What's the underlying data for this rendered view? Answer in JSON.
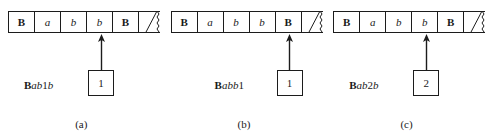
{
  "figure": {
    "type": "turing-machine-tape-configurations",
    "panels": [
      {
        "caption": "(a)",
        "tape": {
          "cells": [
            {
              "symbol": "B",
              "style": "bold"
            },
            {
              "symbol": "a",
              "style": "italic"
            },
            {
              "symbol": "b",
              "style": "italic"
            },
            {
              "symbol": "b",
              "style": "italic"
            },
            {
              "symbol": "B",
              "style": "bold"
            }
          ],
          "has_torn_end": true
        },
        "head_cell_index": 3,
        "state": "1",
        "config_label": {
          "text": "Bab1b",
          "parts": [
            {
              "text": "B",
              "style": "bold"
            },
            {
              "text": "ab",
              "style": "italic"
            },
            {
              "text": "1",
              "style": "normal"
            },
            {
              "text": "b",
              "style": "italic"
            }
          ]
        }
      },
      {
        "caption": "(b)",
        "tape": {
          "cells": [
            {
              "symbol": "B",
              "style": "bold"
            },
            {
              "symbol": "a",
              "style": "italic"
            },
            {
              "symbol": "b",
              "style": "italic"
            },
            {
              "symbol": "b",
              "style": "italic"
            },
            {
              "symbol": "B",
              "style": "bold"
            }
          ],
          "has_torn_end": true
        },
        "head_cell_index": 4,
        "state": "1",
        "config_label": {
          "text": "Babb1",
          "parts": [
            {
              "text": "B",
              "style": "bold"
            },
            {
              "text": "abb",
              "style": "italic"
            },
            {
              "text": "1",
              "style": "normal"
            }
          ]
        }
      },
      {
        "caption": "(c)",
        "tape": {
          "cells": [
            {
              "symbol": "B",
              "style": "bold"
            },
            {
              "symbol": "a",
              "style": "italic"
            },
            {
              "symbol": "b",
              "style": "italic"
            },
            {
              "symbol": "b",
              "style": "italic"
            },
            {
              "symbol": "B",
              "style": "bold"
            }
          ],
          "has_torn_end": true
        },
        "head_cell_index": 3,
        "state": "2",
        "config_label": {
          "text": "Bab2b",
          "parts": [
            {
              "text": "B",
              "style": "bold"
            },
            {
              "text": "ab",
              "style": "italic"
            },
            {
              "text": "2",
              "style": "normal"
            },
            {
              "text": "b",
              "style": "italic"
            }
          ]
        }
      }
    ]
  },
  "colors": {
    "ink": "#1c1c1c",
    "background": "#ffffff"
  }
}
